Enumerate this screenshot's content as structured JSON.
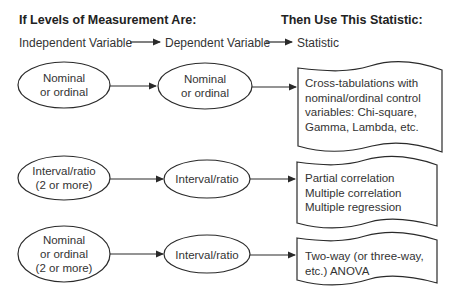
{
  "headers": {
    "left": "If Levels of Measurement Are:",
    "right": "Then Use This Statistic:"
  },
  "subheaders": {
    "independent": "Independent Variable",
    "dependent": "Dependent Variable",
    "statistic": "Statistic"
  },
  "rows": [
    {
      "independent": "Nominal\nor ordinal",
      "dependent": "Nominal\nor ordinal",
      "statistic": "Cross-tabulations with\nnominal/ordinal control\nvariables: Chi-square,\nGamma, Lambda, etc."
    },
    {
      "independent": "Interval/ratio\n(2 or more)",
      "dependent": "Interval/ratio",
      "statistic": "Partial correlation\nMultiple correlation\nMultiple regression"
    },
    {
      "independent": "Nominal\nor ordinal\n(2 or more)",
      "dependent": "Interval/ratio",
      "statistic": "Two-way (or three-way,\netc.) ANOVA"
    }
  ],
  "colors": {
    "stroke": "#2a2a2a",
    "text": "#333333",
    "background": "#ffffff"
  }
}
